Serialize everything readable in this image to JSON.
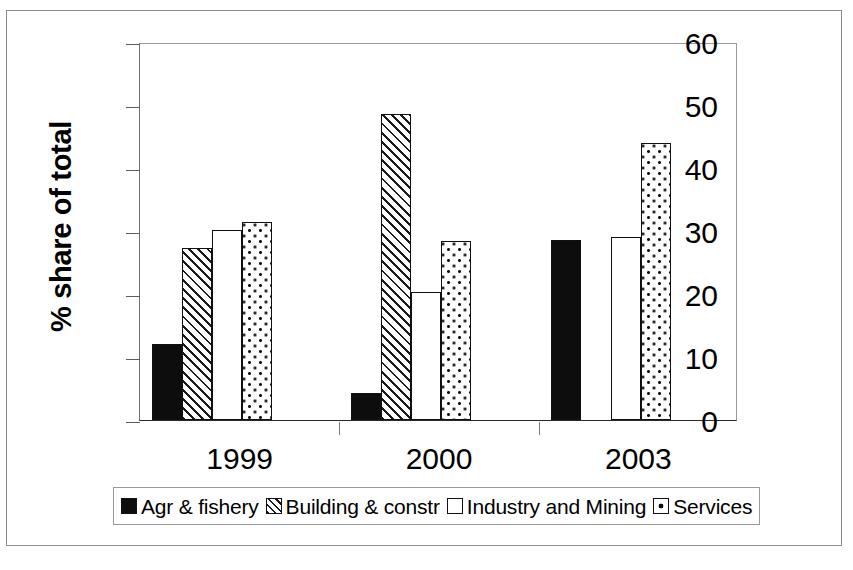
{
  "chart_data": {
    "type": "bar",
    "title": "",
    "subtitle": "",
    "xlabel": "",
    "ylabel": "% share of total",
    "categories": [
      "1999",
      "2000",
      "2003"
    ],
    "ylim": [
      0,
      60
    ],
    "yticks": [
      0,
      10,
      20,
      30,
      40,
      50,
      60
    ],
    "ytick_labels": [
      "0",
      "10",
      "20",
      "30",
      "40",
      "50",
      "60"
    ],
    "grid": false,
    "legend_position": "below",
    "series": [
      {
        "name": "Agr & fishery",
        "fill": "solid",
        "color": "#0d0d0d",
        "values": [
          12.0,
          4.3,
          28.6
        ]
      },
      {
        "name": "Building & constr",
        "fill": "diagonal",
        "color": "#ffffff",
        "values": [
          27.3,
          48.6,
          null
        ]
      },
      {
        "name": "Industry and Mining",
        "fill": "empty",
        "color": "#ffffff",
        "values": [
          30.1,
          20.3,
          29.1
        ]
      },
      {
        "name": "Services",
        "fill": "dotted",
        "color": "#ffffff",
        "values": [
          31.4,
          28.4,
          44.0
        ]
      }
    ]
  },
  "axis": {
    "y_title": "% share of total"
  },
  "legend": {
    "items": [
      {
        "label": "Agr & fishery",
        "fill": "solid"
      },
      {
        "label": "Building & constr",
        "fill": "diagonal"
      },
      {
        "label": "Industry and Mining",
        "fill": "empty"
      },
      {
        "label": "Services",
        "fill": "dotted"
      }
    ]
  }
}
